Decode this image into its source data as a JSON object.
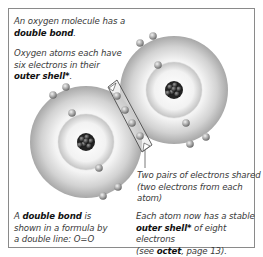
{
  "figure": {
    "intro": {
      "line1_prefix": "An oxygen molecule has a",
      "line2_bold": "double bond",
      "line2_suffix": "."
    },
    "outer_shell_note": {
      "line1": "Oxygen atoms each have",
      "line2": "six electrons in their",
      "line3_bold": "outer shell*",
      "line3_suffix": "."
    },
    "shared_callout": {
      "line1": "Two pairs of electrons shared",
      "line2": "(two electrons from each atom)"
    },
    "formula_note": {
      "line1_prefix": "A ",
      "line1_bold": "double bond",
      "line1_suffix": " is",
      "line2": "shown in a formula by",
      "line3": "a double line: O=O"
    },
    "stable_note": {
      "line1": "Each atom now has a stable",
      "line2_bold": "outer shell*",
      "line2_suffix": " of eight electrons",
      "line3_prefix": "(see ",
      "line3_bold": "octet",
      "line3_suffix": ", page 13)."
    },
    "colors": {
      "frame_border": "#8a8a8a",
      "shell": "#cfcfcf",
      "nucleus": "#2a2a2a",
      "electron": "#9a9a9a",
      "text": "#3a3a3a"
    }
  }
}
